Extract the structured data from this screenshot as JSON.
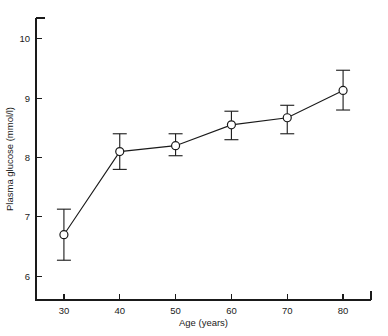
{
  "chart_data": {
    "type": "line",
    "title": "",
    "xlabel": "Age (years)",
    "ylabel": "Plasma glucose (mmol/l)",
    "xlim": [
      25,
      85
    ],
    "ylim": [
      5.6,
      10.35
    ],
    "xticks": [
      30,
      40,
      50,
      60,
      70,
      80
    ],
    "xticklabels": [
      "30",
      "40",
      "50",
      "60",
      "70",
      "80"
    ],
    "yticks": [
      6,
      7,
      8,
      9,
      10
    ],
    "yticklabels": [
      "6",
      "7",
      "8",
      "9",
      "10"
    ],
    "grid": false,
    "legend": "none",
    "marker": "open-circle",
    "error_bars": true,
    "x": [
      30,
      40,
      50,
      60,
      70,
      80
    ],
    "values": [
      6.7,
      8.1,
      8.2,
      8.55,
      8.67,
      9.13
    ],
    "err_low": [
      6.27,
      7.8,
      8.03,
      8.3,
      8.4,
      8.8
    ],
    "err_high": [
      7.13,
      8.4,
      8.4,
      8.78,
      8.88,
      9.47
    ],
    "series": [
      {
        "name": "Plasma glucose",
        "values": [
          6.7,
          8.1,
          8.2,
          8.55,
          8.67,
          9.13
        ]
      }
    ],
    "points": [
      {
        "age": 30,
        "value": 6.7,
        "low": 6.27,
        "high": 7.13
      },
      {
        "age": 40,
        "value": 8.1,
        "low": 7.8,
        "high": 8.4
      },
      {
        "age": 50,
        "value": 8.2,
        "low": 8.03,
        "high": 8.4
      },
      {
        "age": 60,
        "value": 8.55,
        "low": 8.3,
        "high": 8.78
      },
      {
        "age": 70,
        "value": 8.67,
        "low": 8.4,
        "high": 8.88
      },
      {
        "age": 80,
        "value": 9.13,
        "low": 8.8,
        "high": 9.47
      }
    ],
    "colors": {
      "line": "#1a1a1a",
      "marker_face": "#ffffff",
      "marker_edge": "#1a1a1a",
      "axis": "#1a1a1a",
      "background": "#ffffff"
    }
  }
}
